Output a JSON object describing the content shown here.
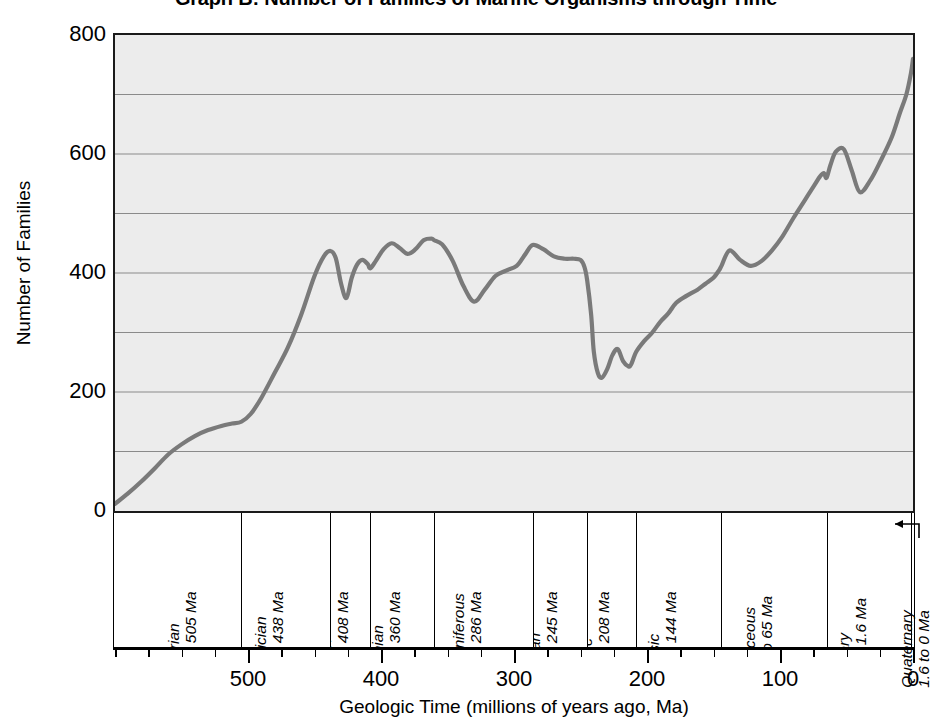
{
  "title": "Graph B: Number of Families of Marine Organisms through Time",
  "axes": {
    "y_title": "Number of Families",
    "x_title": "Geologic Time (millions of years ago, Ma)",
    "y_tick_labels": [
      "800",
      "600",
      "400",
      "200",
      "0"
    ],
    "x_tick_labels": [
      "500",
      "400",
      "300",
      "200",
      "100",
      "0"
    ]
  },
  "periods": [
    {
      "name": "Cambrian",
      "range": "570 to 505 Ma",
      "start": 570,
      "end": 505
    },
    {
      "name": "Ordovician",
      "range": "505 to 438 Ma",
      "start": 505,
      "end": 438
    },
    {
      "name": "Silurian",
      "range": "438 to 408 Ma",
      "start": 438,
      "end": 408
    },
    {
      "name": "Devonian",
      "range": "408 to 360 Ma",
      "start": 408,
      "end": 360
    },
    {
      "name": "Carboniferous",
      "range": "360 to 286 Ma",
      "start": 360,
      "end": 286
    },
    {
      "name": "Permian",
      "range": "286 to 245 Ma",
      "start": 286,
      "end": 245
    },
    {
      "name": "Triassic",
      "range": "245 to 208 Ma",
      "start": 245,
      "end": 208
    },
    {
      "name": "Jurassic",
      "range": "208 to 144 Ma",
      "start": 208,
      "end": 144
    },
    {
      "name": "Cretaceous",
      "range": "144 to 65 Ma",
      "start": 144,
      "end": 65
    },
    {
      "name": "Tertiary",
      "range": "65 to 1.6 Ma",
      "start": 65,
      "end": 1.6
    },
    {
      "name": "Quaternary",
      "range": "1.6 to 0 Ma",
      "start": 1.6,
      "end": 0
    }
  ],
  "chart_data": {
    "type": "line",
    "title": "Graph B: Number of Families of Marine Organisms through Time",
    "xlabel": "Geologic Time (millions of years ago, Ma)",
    "ylabel": "Number of Families",
    "xlim": [
      600,
      0
    ],
    "ylim": [
      0,
      800
    ],
    "x_reversed": true,
    "grid": "horizontal",
    "y_major_ticks": [
      0,
      200,
      400,
      600,
      800
    ],
    "y_minor_gridlines": [
      100,
      300,
      500,
      700
    ],
    "x_major_ticks": [
      500,
      400,
      300,
      200,
      100,
      0
    ],
    "x_minor_tick_step": 25,
    "legend": null,
    "line_color": "#7a7a7a",
    "plot_background": "#ececec",
    "series": [
      {
        "name": "Number of marine families",
        "x": [
          600,
          590,
          580,
          570,
          560,
          550,
          540,
          530,
          520,
          512,
          505,
          498,
          490,
          480,
          470,
          460,
          450,
          443,
          438,
          434,
          430,
          426,
          422,
          418,
          414,
          410,
          408,
          404,
          398,
          392,
          386,
          380,
          374,
          368,
          362,
          360,
          354,
          346,
          338,
          330,
          322,
          314,
          306,
          298,
          292,
          286,
          278,
          270,
          262,
          255,
          250,
          247,
          245,
          242,
          240,
          237,
          234,
          230,
          226,
          222,
          218,
          214,
          212,
          208,
          202,
          196,
          190,
          184,
          178,
          170,
          162,
          156,
          150,
          146,
          144,
          138,
          130,
          122,
          114,
          106,
          98,
          90,
          82,
          74,
          70,
          67,
          65,
          62,
          58,
          52,
          46,
          40,
          32,
          24,
          16,
          10,
          5,
          1.6,
          0
        ],
        "y": [
          12,
          30,
          50,
          72,
          95,
          112,
          126,
          136,
          143,
          147,
          150,
          163,
          190,
          232,
          275,
          330,
          395,
          428,
          437,
          425,
          382,
          358,
          392,
          414,
          422,
          415,
          408,
          420,
          440,
          450,
          442,
          432,
          440,
          455,
          458,
          455,
          448,
          420,
          378,
          352,
          372,
          395,
          404,
          412,
          430,
          447,
          440,
          428,
          424,
          424,
          422,
          410,
          388,
          330,
          268,
          232,
          224,
          238,
          262,
          272,
          252,
          243,
          246,
          268,
          286,
          300,
          318,
          332,
          350,
          362,
          372,
          382,
          392,
          404,
          412,
          438,
          422,
          412,
          420,
          438,
          462,
          492,
          520,
          548,
          562,
          568,
          560,
          582,
          604,
          608,
          572,
          536,
          556,
          590,
          628,
          668,
          700,
          735,
          760
        ]
      }
    ],
    "annotations": [
      {
        "label": "End-Ordovician extinction",
        "x": 438,
        "y": 358
      },
      {
        "label": "Late Devonian extinction",
        "x": 360,
        "y": 352
      },
      {
        "label": "End-Permian extinction",
        "x": 245,
        "y": 224
      },
      {
        "label": "End-Triassic extinction",
        "x": 208,
        "y": 243
      },
      {
        "label": "End-Cretaceous extinction",
        "x": 65,
        "y": 536
      }
    ]
  }
}
